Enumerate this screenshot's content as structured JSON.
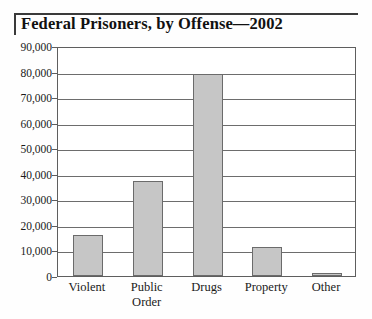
{
  "chart_data": {
    "type": "bar",
    "title": "Federal Prisoners, by Offense—2002",
    "xlabel": "",
    "ylabel": "",
    "categories": [
      "Violent",
      "Public\nOrder",
      "Drugs",
      "Property",
      "Other"
    ],
    "values": [
      15900,
      37000,
      79000,
      11500,
      1300
    ],
    "ylim": [
      0,
      90000
    ],
    "ytick_labels": [
      "90,000",
      "80,000",
      "70,000",
      "60,000",
      "50,000",
      "40,000",
      "30,000",
      "20,000",
      "10,000",
      "0"
    ],
    "ytick_values": [
      90000,
      80000,
      70000,
      60000,
      50000,
      40000,
      30000,
      20000,
      10000,
      0
    ],
    "grid": true,
    "legend": "none",
    "colors": {
      "bar_fill": "#c6c6c6",
      "bar_border": "#6b6b6b",
      "gridline": "#6d6d6d",
      "frame": "#5e5e5e",
      "text": "#1a1a1a",
      "background": "#ffffff"
    }
  }
}
